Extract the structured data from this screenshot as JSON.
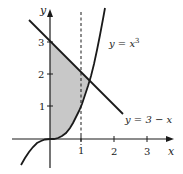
{
  "diagram": {
    "type": "function-graph",
    "axes": {
      "x_label": "x",
      "y_label": "y",
      "x_ticks": [
        "1",
        "2",
        "3"
      ],
      "y_ticks": [
        "1",
        "2",
        "3"
      ]
    },
    "curves": [
      {
        "name": "cubic",
        "label_lhs": "y = ",
        "label_var": "x",
        "label_exp": "3"
      },
      {
        "name": "line",
        "label": "y = 3 − x"
      }
    ],
    "dashed_line": {
      "x": 1
    },
    "shaded_region": {
      "description": "Region between y = x^3 and y = 3 - x from x = 0 to their intersection"
    },
    "colors": {
      "stroke": "#1a1a1a",
      "shade": "#c8c8c8"
    }
  }
}
